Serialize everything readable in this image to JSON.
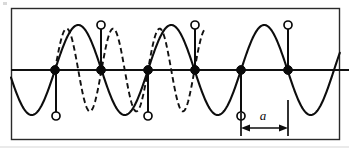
{
  "figure": {
    "frame": {
      "x": 11,
      "y": 8,
      "width": 329,
      "height": 132
    },
    "axis": {
      "y": 70,
      "x_start": 11,
      "x_end": 349,
      "label": "time-axis"
    },
    "colors": {
      "ink": "#0d0d0d",
      "frame": "#2a2a2a",
      "background": "#ffffff",
      "open_marker_fill": "#ffffff"
    }
  },
  "chart_data": {
    "type": "line",
    "xlabel": "",
    "ylabel": "",
    "xlim": [
      11,
      349
    ],
    "ylim": [
      -1.05,
      1.05
    ],
    "grid": false,
    "legend": "none",
    "axis_y_pixel": 70,
    "amplitude_pixels": 45,
    "sample_spacing_pixels": 46.5,
    "sample_count": 6,
    "series": [
      {
        "name": "reconstructed-low-frequency-sine",
        "style": "solid",
        "period_pixels": 93.0,
        "x_start": 11,
        "x_end": 340,
        "phase_zero_x": 55,
        "amplitude": 1.0,
        "description": "Solid curve: the aliased low-frequency sinusoid, two samples per cycle"
      },
      {
        "name": "original-high-frequency-sine",
        "style": "dashed",
        "period_pixels": 46.5,
        "x_start": 55,
        "x_end": 205,
        "phase_zero_x": 55,
        "amplitude": 0.92,
        "description": "Dashed curve: the original higher-frequency sinusoid passing through the same samples"
      }
    ],
    "sample_points": [
      {
        "index": 0,
        "x": 55,
        "axis_y": 70,
        "marker": "filled",
        "value": 0
      },
      {
        "index": 1,
        "x": 101,
        "axis_y": 70,
        "marker": "filled",
        "value": 0
      },
      {
        "index": 2,
        "x": 148,
        "axis_y": 70,
        "marker": "filled",
        "value": 0
      },
      {
        "index": 3,
        "x": 195,
        "axis_y": 70,
        "marker": "filled",
        "value": 0
      },
      {
        "index": 4,
        "x": 241,
        "axis_y": 70,
        "marker": "filled",
        "value": 0
      },
      {
        "index": 5,
        "x": 288,
        "axis_y": 70,
        "marker": "filled",
        "value": 0
      }
    ],
    "extreme_points": [
      {
        "index": 0,
        "x": 56,
        "y": 116,
        "marker": "open",
        "value": -1,
        "kind": "trough"
      },
      {
        "index": 1,
        "x": 101,
        "y": 25,
        "marker": "open",
        "value": 1,
        "kind": "peak"
      },
      {
        "index": 2,
        "x": 148,
        "y": 116,
        "marker": "open",
        "value": -1,
        "kind": "trough"
      },
      {
        "index": 3,
        "x": 195,
        "y": 25,
        "marker": "open",
        "value": 1,
        "kind": "peak"
      },
      {
        "index": 4,
        "x": 241,
        "y": 116,
        "marker": "open",
        "value": -1,
        "kind": "trough"
      },
      {
        "index": 5,
        "x": 288,
        "y": 25,
        "marker": "open",
        "value": 1,
        "kind": "peak"
      }
    ],
    "annotations": [
      {
        "name": "sample-interval",
        "label": "a",
        "style": "italic",
        "kind": "double-headed-dimension-arrow",
        "x_from": 241,
        "x_to": 288,
        "arrow_y": 128,
        "label_x": 263,
        "label_y": 120,
        "meaning": "sampling interval between adjacent sample points"
      }
    ]
  },
  "annotation": {
    "dimension_label": "a"
  }
}
